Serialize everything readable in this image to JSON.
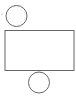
{
  "diagram": {
    "stroke_color": "#555555",
    "background": "#ffffff",
    "shapes": {
      "top_circle": {
        "cx": 16.5,
        "cy": 16,
        "r": 10.5
      },
      "rectangle": {
        "x": 5,
        "y": 30.5,
        "width": 69,
        "height": 40
      },
      "bottom_circle": {
        "cx": 39,
        "cy": 82.5,
        "r": 10.5
      },
      "mark": {
        "x": 2,
        "y": 14
      }
    }
  }
}
